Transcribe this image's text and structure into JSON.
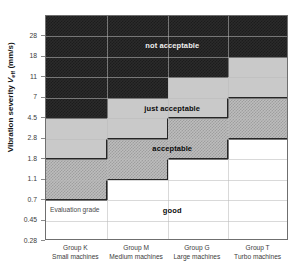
{
  "chart_data": {
    "type": "heatmap",
    "title": "",
    "xlabel": "",
    "ylabel": "Vibration severity Veff (mm/s)",
    "ylabel_parts": {
      "pre": "Vibration severity ",
      "symbol": "V",
      "sub": "eff",
      "unit": " (mm/s)"
    },
    "grid": true,
    "legend": "none",
    "ytick_labels": [
      "28",
      "18",
      "11",
      "7",
      "4.5",
      "2.8",
      "1.8",
      "1.1",
      "0.7",
      "0.45",
      "0.28"
    ],
    "ytick_values": [
      28,
      18,
      11,
      7,
      4.5,
      2.8,
      1.8,
      1.1,
      0.7,
      0.45,
      0.28
    ],
    "ylim": [
      "0.28",
      "45"
    ],
    "categories": [
      "Group K",
      "Group M",
      "Group G",
      "Group T"
    ],
    "category_sublabels": [
      "Small machines",
      "Medium machines",
      "Large machines",
      "Turbo machines"
    ],
    "zones": [
      {
        "name": "good",
        "label": "good",
        "color": "#ffffff",
        "upper_limits": [
          "0.7",
          "1.1",
          "1.8",
          "2.8"
        ]
      },
      {
        "name": "acceptable",
        "label": "acceptable",
        "color": "#bdbdbd",
        "upper_limits": [
          "1.8",
          "2.8",
          "4.5",
          "7"
        ]
      },
      {
        "name": "just_acceptable",
        "label": "just acceptable",
        "color": "#c9c9c9",
        "upper_limits": [
          "4.5",
          "7",
          "11",
          "18"
        ]
      },
      {
        "name": "not_acceptable",
        "label": "not acceptable",
        "color": "#2a2a2a",
        "upper_limits": [
          "top",
          "top",
          "top",
          "top"
        ]
      }
    ],
    "annotations": [
      {
        "text": "not acceptable",
        "zone": "not_acceptable"
      },
      {
        "text": "just acceptable",
        "zone": "just_acceptable"
      },
      {
        "text": "acceptable",
        "zone": "acceptable"
      },
      {
        "text": "good",
        "zone": "good"
      },
      {
        "text": "Evaluation grade",
        "zone": "good"
      }
    ]
  },
  "axis": {
    "y_title_pre": "Vibration severity ",
    "y_title_symbol": "V",
    "y_title_sub": "eff",
    "y_title_unit": " (mm/s)",
    "ticks": [
      "28",
      "18",
      "11",
      "7",
      "4.5",
      "2.8",
      "1.8",
      "1.1",
      "0.7",
      "0.45",
      "0.28"
    ]
  },
  "groups": [
    {
      "name": "Group K",
      "sub": "Small machines"
    },
    {
      "name": "Group M",
      "sub": "Medium machines"
    },
    {
      "name": "Group G",
      "sub": "Large machines"
    },
    {
      "name": "Group T",
      "sub": "Turbo machines"
    }
  ],
  "labels": {
    "not_acceptable": "not acceptable",
    "just_acceptable": "just acceptable",
    "acceptable": "acceptable",
    "good": "good",
    "evaluation_grade": "Evaluation grade"
  },
  "colors": {
    "not_acceptable": "#2a2a2a",
    "just_acceptable": "#c9c9c9",
    "acceptable": "#bdbdbd",
    "good": "#ffffff",
    "grid": "#b9b9b9",
    "frame": "#6f6f6f",
    "edge": "#262626"
  }
}
